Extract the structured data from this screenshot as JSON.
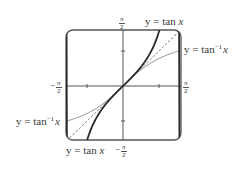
{
  "chart_data": {
    "type": "line",
    "title": "",
    "xlabel": "",
    "ylabel": "",
    "xlim": [
      -1.5708,
      1.5708
    ],
    "ylim": [
      -1.5708,
      1.5708
    ],
    "x_tick_labels": [
      "-π/2",
      "π/2"
    ],
    "y_tick_labels": [
      "π/2",
      "-π/2"
    ],
    "minor_ticks": [
      -1,
      1
    ],
    "grid": false,
    "series": [
      {
        "name": "y = tan x",
        "function": "tan",
        "style": "thick solid",
        "color": "#2a2a2a"
      },
      {
        "name": "y = tan^-1 x",
        "function": "atan",
        "style": "thin solid",
        "color": "#7a7a7a"
      },
      {
        "name": "y = x",
        "function": "identity",
        "style": "dashed",
        "color": "#555555"
      }
    ]
  },
  "labels": {
    "tan_top": {
      "prefix": "y = tan ",
      "var": "x"
    },
    "atan_right": {
      "prefix": "y = tan",
      "sup": "−1",
      "var": "x"
    },
    "atan_left": {
      "prefix": "y = tan",
      "sup": "−1",
      "var": "x"
    },
    "tan_bottom": {
      "prefix": "y = tan ",
      "var": "x"
    },
    "pi_num": "π",
    "pi_den": "2",
    "minus": "−"
  }
}
